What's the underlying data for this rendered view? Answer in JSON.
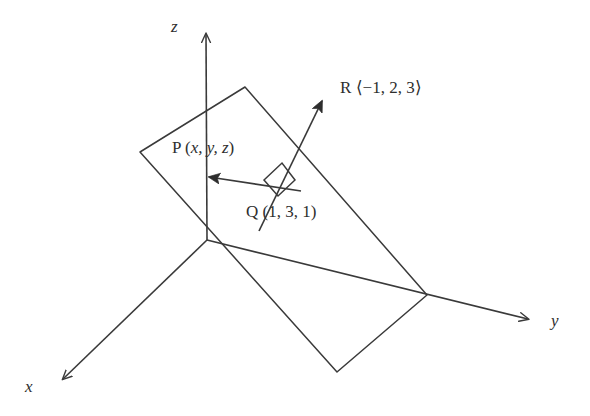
{
  "figure": {
    "background_color": "#ffffff",
    "stroke_color": "#3a3a3a",
    "text_color": "#2e2e2e",
    "width": 590,
    "height": 416
  },
  "axes": {
    "x": {
      "label": "x",
      "label_x": 25,
      "label_y": 378,
      "origin": [
        207,
        240
      ],
      "tip": [
        58,
        384
      ]
    },
    "y": {
      "label": "y",
      "label_x": 551,
      "label_y": 312,
      "origin": [
        207,
        240
      ],
      "tip": [
        533,
        320
      ]
    },
    "z": {
      "label": "z",
      "label_x": 171,
      "label_y": 18,
      "origin": [
        207,
        240
      ],
      "tip": [
        206,
        30
      ]
    }
  },
  "plane": {
    "name": "plane",
    "corners": [
      [
        245,
        87
      ],
      [
        427,
        295
      ],
      [
        337,
        372
      ],
      [
        140,
        152
      ]
    ]
  },
  "points": [
    {
      "id": "P",
      "label": "P (x, y, z)",
      "name_part": "P (",
      "coords_italic": "x, y, z",
      "close_part": ")",
      "label_x": 172,
      "label_y": 139,
      "marker": [
        200,
        175
      ]
    },
    {
      "id": "Q",
      "label": "Q (1, 3, 1)",
      "name_part": "Q (",
      "coords_italic": "",
      "close_part": "1, 3, 1)",
      "label_x": 246,
      "label_y": 203,
      "marker": [
        300,
        190
      ]
    },
    {
      "id": "R",
      "label": "R ⟨−1, 2, 3⟩",
      "name_part": "R ⟨",
      "coords_italic": "",
      "close_part": "−1, 2, 3⟩",
      "label_x": 340,
      "label_y": 79,
      "marker": [
        325,
        95
      ]
    }
  ],
  "vectors": [
    {
      "id": "QP",
      "from": [
        300,
        190
      ],
      "to": [
        200,
        175
      ],
      "description": "vector from Q to P inside the plane"
    },
    {
      "id": "QR",
      "from": [
        259,
        231
      ],
      "to": [
        325,
        95
      ],
      "description": "normal vector R from Q out of the plane"
    }
  ],
  "right_angle": {
    "name": "right-angle-marker",
    "vertices": [
      [
        264,
        180
      ],
      [
        282,
        163
      ],
      [
        295,
        180
      ],
      [
        278,
        196
      ]
    ]
  }
}
